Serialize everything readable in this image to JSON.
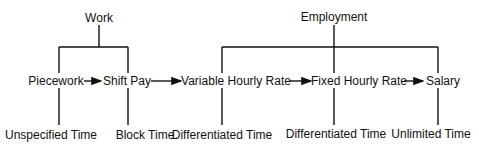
{
  "diagram": {
    "groups": [
      {
        "label": "Work",
        "x": 99
      },
      {
        "label": "Employment",
        "x": 334
      }
    ],
    "nodes": [
      {
        "label": "Piecework",
        "x": 55,
        "branch_x": 59,
        "time": "Unspecified Time",
        "time_x": 60
      },
      {
        "label": "Shift Pay",
        "x": 128,
        "branch_x": 128,
        "time": "Block Time",
        "time_x": 128
      },
      {
        "label": "Variable Hourly Rate",
        "x": 236,
        "branch_x": 222,
        "time": "Differentiated Time",
        "time_x": 236
      },
      {
        "label": "Fixed Hourly Rate",
        "x": 360,
        "branch_x": 334,
        "time": "Differentiated Time",
        "time_x": 360
      },
      {
        "label": "Salary",
        "x": 443,
        "branch_x": 438,
        "time": "Unlimited Time",
        "time_x": 431
      }
    ],
    "arrows": [
      {
        "from": "Piecework",
        "to": "Shift Pay"
      },
      {
        "from": "Shift Pay",
        "to": "Variable Hourly Rate"
      },
      {
        "from": "Variable Hourly Rate",
        "to": "Fixed Hourly Rate"
      },
      {
        "from": "Fixed Hourly Rate",
        "to": "Salary"
      }
    ]
  }
}
